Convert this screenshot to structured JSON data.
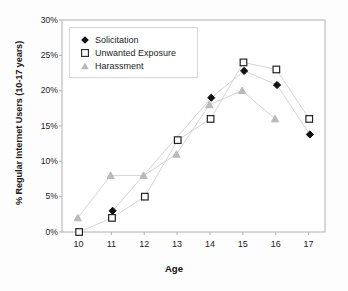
{
  "chart_data": {
    "type": "line",
    "title": "",
    "xlabel": "Age",
    "ylabel": "% Regular Internet Users (10-17 years)",
    "x": [
      10,
      11,
      12,
      13,
      14,
      15,
      16,
      17
    ],
    "categories": [
      "10",
      "11",
      "12",
      "13",
      "14",
      "15",
      "16",
      "17"
    ],
    "xlim": [
      9.5,
      17.5
    ],
    "ylim": [
      0,
      30
    ],
    "ytick_labels": [
      "0%",
      "5%",
      "10%",
      "15%",
      "20%",
      "25%",
      "30%"
    ],
    "ytick_values": [
      0,
      5,
      10,
      15,
      20,
      25,
      30
    ],
    "xtick_labels": [
      "10",
      "11",
      "12",
      "13",
      "14",
      "15",
      "16",
      "17"
    ],
    "grid": false,
    "legend_position": "upper left",
    "series": [
      {
        "name": "Solicitation",
        "marker": "filled-diamond",
        "color": "#111111",
        "x": [
          11,
          14,
          15,
          16,
          17
        ],
        "values": [
          3.0,
          19.0,
          22.8,
          20.8,
          13.8
        ]
      },
      {
        "name": "Unwanted Exposure",
        "marker": "open-square",
        "color": "#222222",
        "x": [
          10,
          11,
          12,
          13,
          14,
          15,
          16,
          17
        ],
        "values": [
          0.0,
          2.0,
          5.0,
          13.0,
          16.0,
          24.0,
          23.0,
          16.0
        ]
      },
      {
        "name": "Harassment",
        "marker": "filled-triangle",
        "color": "#b9b9b9",
        "x": [
          10,
          11,
          12,
          13,
          14,
          15,
          16
        ],
        "values": [
          2.0,
          8.0,
          8.0,
          11.0,
          18.0,
          20.0,
          16.0
        ]
      }
    ]
  },
  "axes": {
    "y_title": "% Regular Internet Users (10-17 years)",
    "x_title": "Age"
  },
  "legend": {
    "items": [
      {
        "label": "Solicitation",
        "marker": "filled-diamond"
      },
      {
        "label": "Unwanted Exposure",
        "marker": "open-square"
      },
      {
        "label": "Harassment",
        "marker": "filled-triangle"
      }
    ]
  },
  "colors": {
    "solicitation": "#111111",
    "unwanted_exposure": "#222222",
    "harassment": "#b9b9b9",
    "connector_line": "#d5d5d5",
    "axis": "#b0b0b0",
    "background": "#fdfdfd"
  }
}
